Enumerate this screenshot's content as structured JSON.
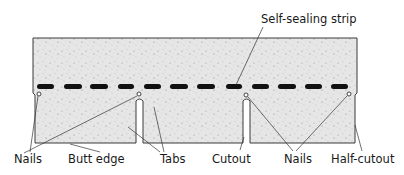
{
  "diagram": {
    "labels": {
      "self_sealing_strip": "Self-sealing strip",
      "nails_left": "Nails",
      "butt_edge": "Butt edge",
      "tabs": "Tabs",
      "cutout": "Cutout",
      "nails_right": "Nails",
      "half_cutout": "Half-cutout"
    },
    "colors": {
      "shingle_fill": "#e4e4e4",
      "outline": "#3a3a3a",
      "strip": "#111111",
      "leader": "#333333"
    }
  }
}
